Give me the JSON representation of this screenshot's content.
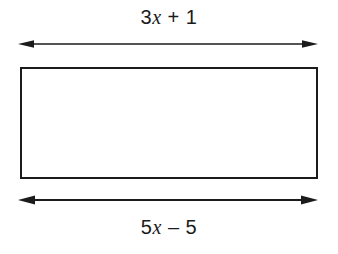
{
  "figure": {
    "background_color": "#ffffff",
    "stroke_color": "#1b1b1b",
    "text_color": "#1b1b1b"
  },
  "labels": {
    "top": {
      "full_text": "3x + 1",
      "coefficient": "3",
      "variable": "x",
      "operator": "+",
      "constant": "1",
      "semantic": "top-dimension-expression"
    },
    "bottom": {
      "full_text": "5x – 5",
      "coefficient": "5",
      "variable": "x",
      "operator": "–",
      "constant": "5",
      "semantic": "bottom-dimension-expression"
    }
  },
  "shape": {
    "type": "rectangle",
    "x": 21,
    "y": 68,
    "width": 296,
    "height": 110,
    "fill": "none",
    "stroke_width": 2
  },
  "arrows": {
    "top": {
      "name": "top-dimension-arrow",
      "x1": 18,
      "x2": 318,
      "y": 44,
      "double_headed": true
    },
    "bottom": {
      "name": "bottom-dimension-arrow",
      "x1": 18,
      "x2": 318,
      "y": 200,
      "double_headed": true
    }
  }
}
